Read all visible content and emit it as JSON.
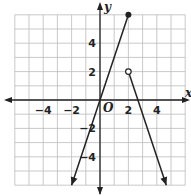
{
  "chart_data": {
    "type": "line",
    "title": "",
    "xlabel": "x",
    "ylabel": "y",
    "origin_label": "O",
    "xlim": [
      -6,
      6
    ],
    "ylim": [
      -6,
      6
    ],
    "grid": true,
    "grid_step": 1,
    "x_ticks": [
      "−4",
      "−2",
      "2",
      "4"
    ],
    "x_tick_values": [
      -4,
      -2,
      2,
      4
    ],
    "y_ticks": [
      "4",
      "2",
      "−2",
      "−4"
    ],
    "y_tick_values": [
      4,
      2,
      -2,
      -4
    ],
    "series": [
      {
        "name": "piece-1",
        "description": "y = 3x for x ≤ 2",
        "points": [
          [
            -2,
            -6
          ],
          [
            2,
            6
          ]
        ],
        "start": "arrow",
        "end": "closed-dot",
        "end_point": [
          2,
          6
        ]
      },
      {
        "name": "piece-2",
        "description": "y = -3x + 8 for x > 2",
        "points": [
          [
            2,
            2
          ],
          [
            4.67,
            -6
          ]
        ],
        "start": "open-dot",
        "start_point": [
          2,
          2
        ],
        "end": "arrow"
      }
    ],
    "colors": {
      "line": "#222222",
      "grid": "#bbbbbb",
      "axis": "#222222"
    }
  }
}
